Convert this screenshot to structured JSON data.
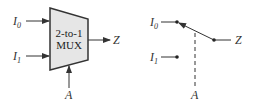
{
  "mux_diagram": {
    "title_line1": "2-to-1",
    "title_line2": "MUX",
    "input0": "I",
    "input0_sub": "0",
    "input1": "I",
    "input1_sub": "1",
    "output": "Z",
    "select": "A",
    "fill_color": "#e6e6e6",
    "stroke_color": "#333333"
  },
  "switch_diagram": {
    "input0": "I",
    "input0_sub": "0",
    "input1": "I",
    "input1_sub": "1",
    "output": "Z",
    "select": "A"
  }
}
